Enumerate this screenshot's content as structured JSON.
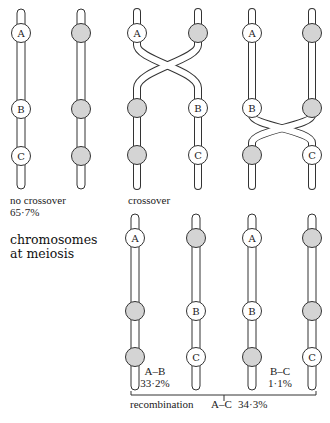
{
  "title": {
    "line1": "chromosomes",
    "line2": "at meiosis"
  },
  "top_row": {
    "no_crossover": {
      "label": "no crossover",
      "percent": "65·7%",
      "chromosome_left": [
        "A",
        "B",
        "C"
      ],
      "chromosome_right": [
        "shaded",
        "shaded",
        "shaded"
      ]
    },
    "crossover_ab": {
      "label": "crossover",
      "chromosome_left": [
        "A",
        "shaded",
        "shaded"
      ],
      "chromosome_right": [
        "shaded",
        "B",
        "C"
      ]
    },
    "crossover_bc": {
      "chromosome_left": [
        "A",
        "B",
        "shaded"
      ],
      "chromosome_right": [
        "shaded",
        "shaded",
        "C"
      ]
    }
  },
  "bottom_row": {
    "chromosomes": [
      [
        "A",
        "shaded",
        "shaded"
      ],
      [
        "shaded",
        "B",
        "C"
      ],
      [
        "A",
        "B",
        "shaded"
      ],
      [
        "shaded",
        "shaded",
        "C"
      ]
    ],
    "ab_label": "A–B",
    "ab_percent": "33·2%",
    "bc_label": "B–C",
    "bc_percent": "1·1%",
    "recombination_label": "recombination",
    "ac_label": "A–C",
    "ac_percent": "34·3%"
  },
  "bead_letters": {
    "A": "A",
    "B": "B",
    "C": "C"
  }
}
